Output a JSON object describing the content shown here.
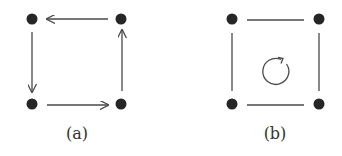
{
  "diagram": {
    "colors": {
      "node": "#262626",
      "edge": "#4a4a4a",
      "label": "#333333",
      "background": "#ffffff"
    },
    "panels": [
      {
        "id": "a",
        "label": "(a)",
        "description": "Four vertices of a square with directed edges forming a counterclockwise cycle",
        "nodes": [
          {
            "id": "a-tl",
            "x": 32,
            "y": 19
          },
          {
            "id": "a-tr",
            "x": 121,
            "y": 19
          },
          {
            "id": "a-bl",
            "x": 32,
            "y": 104
          },
          {
            "id": "a-br",
            "x": 121,
            "y": 104
          }
        ],
        "edges": [
          {
            "from": "a-tr",
            "to": "a-tl",
            "directed": true
          },
          {
            "from": "a-tl",
            "to": "a-bl",
            "directed": true
          },
          {
            "from": "a-bl",
            "to": "a-br",
            "directed": true
          },
          {
            "from": "a-br",
            "to": "a-tr",
            "directed": true
          }
        ]
      },
      {
        "id": "b",
        "label": "(b)",
        "description": "Four vertices of a square with undirected edges and a circular counterclockwise arrow in the center",
        "nodes": [
          {
            "id": "b-tl",
            "x": 232,
            "y": 19
          },
          {
            "id": "b-tr",
            "x": 319,
            "y": 19
          },
          {
            "id": "b-bl",
            "x": 232,
            "y": 104
          },
          {
            "id": "b-br",
            "x": 319,
            "y": 104
          }
        ],
        "edges": [
          {
            "from": "b-tl",
            "to": "b-tr",
            "directed": false
          },
          {
            "from": "b-tl",
            "to": "b-bl",
            "directed": false
          },
          {
            "from": "b-bl",
            "to": "b-br",
            "directed": false
          },
          {
            "from": "b-tr",
            "to": "b-br",
            "directed": false
          }
        ],
        "center_symbol": {
          "icon": "circular-arrow-counterclockwise",
          "cx": 274,
          "cy": 71,
          "r": 13
        }
      }
    ]
  }
}
